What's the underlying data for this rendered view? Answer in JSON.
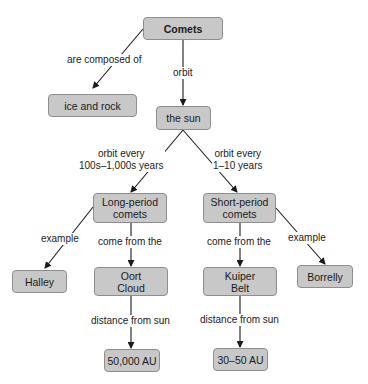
{
  "diagram": {
    "type": "concept-map",
    "nodes": {
      "comets": "Comets",
      "ice_rock": "ice and rock",
      "sun": "the sun",
      "long_period": [
        "Long-period",
        "comets"
      ],
      "short_period": [
        "Short-period",
        "comets"
      ],
      "halley": "Halley",
      "oort": [
        "Oort",
        "Cloud"
      ],
      "kuiper": [
        "Kuiper",
        "Belt"
      ],
      "borrelly": "Borrelly",
      "dist_oort": "50,000 AU",
      "dist_kuiper": "30–50 AU"
    },
    "links": {
      "composed": "are composed of",
      "orbit": "orbit",
      "orbit_long": [
        "orbit every",
        "100s–1,000s years"
      ],
      "orbit_short": [
        "orbit every",
        "1–10 years"
      ],
      "example_long": "example",
      "from_long": "come from the",
      "from_short": "come from the",
      "example_short": "example",
      "dist_long": "distance from sun",
      "dist_short": "distance from sun"
    },
    "colors": {
      "node_fill": "#c8c8c8",
      "node_border": "#8e8e8e",
      "line": "#1a1a1a"
    }
  }
}
